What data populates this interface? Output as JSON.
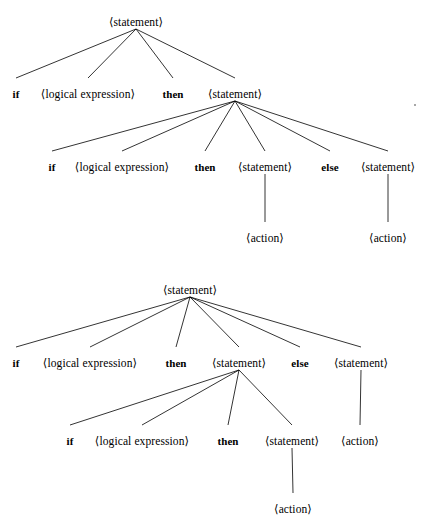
{
  "figure": {
    "background_color": "#ffffff",
    "ink_color": "#000000",
    "trees": [
      {
        "name": "tree-top",
        "description": "else associated with the inner (second) if statement",
        "nodes": [
          {
            "id": "t1-root",
            "label": "⟨statement⟩",
            "kind": "nonterminal",
            "x": 136,
            "y": 16
          },
          {
            "id": "t1-if",
            "label": "if",
            "kind": "terminal",
            "x": 16,
            "y": 88
          },
          {
            "id": "t1-logexp",
            "label": "⟨logical expression⟩",
            "kind": "nonterminal",
            "x": 88,
            "y": 88
          },
          {
            "id": "t1-then",
            "label": "then",
            "kind": "terminal",
            "x": 173,
            "y": 88
          },
          {
            "id": "t1-stmt",
            "label": "⟨statement⟩",
            "kind": "nonterminal",
            "x": 235,
            "y": 88
          },
          {
            "id": "t1-if2",
            "label": "if",
            "kind": "terminal",
            "x": 52,
            "y": 161
          },
          {
            "id": "t1-logexp2",
            "label": "⟨logical expression⟩",
            "kind": "nonterminal",
            "x": 122,
            "y": 161
          },
          {
            "id": "t1-then2",
            "label": "then",
            "kind": "terminal",
            "x": 205,
            "y": 161
          },
          {
            "id": "t1-stmt2",
            "label": "⟨statement⟩",
            "kind": "nonterminal",
            "x": 265,
            "y": 161
          },
          {
            "id": "t1-else",
            "label": "else",
            "kind": "terminal",
            "x": 330,
            "y": 161
          },
          {
            "id": "t1-stmt3",
            "label": "⟨statement⟩",
            "kind": "nonterminal",
            "x": 388,
            "y": 161
          },
          {
            "id": "t1-action1",
            "label": "⟨action⟩",
            "kind": "nonterminal",
            "x": 265,
            "y": 232
          },
          {
            "id": "t1-action2",
            "label": "⟨action⟩",
            "kind": "nonterminal",
            "x": 388,
            "y": 232
          }
        ],
        "edges": [
          {
            "from": "t1-root",
            "to": "t1-if"
          },
          {
            "from": "t1-root",
            "to": "t1-logexp"
          },
          {
            "from": "t1-root",
            "to": "t1-then"
          },
          {
            "from": "t1-root",
            "to": "t1-stmt"
          },
          {
            "from": "t1-stmt",
            "to": "t1-if2"
          },
          {
            "from": "t1-stmt",
            "to": "t1-logexp2"
          },
          {
            "from": "t1-stmt",
            "to": "t1-then2"
          },
          {
            "from": "t1-stmt",
            "to": "t1-stmt2"
          },
          {
            "from": "t1-stmt",
            "to": "t1-else"
          },
          {
            "from": "t1-stmt",
            "to": "t1-stmt3"
          },
          {
            "from": "t1-stmt2",
            "to": "t1-action1"
          },
          {
            "from": "t1-stmt3",
            "to": "t1-action2"
          }
        ]
      },
      {
        "name": "tree-bottom",
        "description": "else associated with the outer (first) if statement",
        "nodes": [
          {
            "id": "t2-root",
            "label": "⟨statement⟩",
            "kind": "nonterminal",
            "x": 190,
            "y": 284
          },
          {
            "id": "t2-if",
            "label": "if",
            "kind": "terminal",
            "x": 16,
            "y": 357
          },
          {
            "id": "t2-logexp",
            "label": "⟨logical expression⟩",
            "kind": "nonterminal",
            "x": 90,
            "y": 357
          },
          {
            "id": "t2-then",
            "label": "then",
            "kind": "terminal",
            "x": 176,
            "y": 357
          },
          {
            "id": "t2-stmt",
            "label": "⟨statement⟩",
            "kind": "nonterminal",
            "x": 239,
            "y": 357
          },
          {
            "id": "t2-else",
            "label": "else",
            "kind": "terminal",
            "x": 300,
            "y": 357
          },
          {
            "id": "t2-stmt3",
            "label": "⟨statement⟩",
            "kind": "nonterminal",
            "x": 361,
            "y": 357
          },
          {
            "id": "t2-if2",
            "label": "if",
            "kind": "terminal",
            "x": 70,
            "y": 435
          },
          {
            "id": "t2-logexp2",
            "label": "⟨logical expression⟩",
            "kind": "nonterminal",
            "x": 142,
            "y": 435
          },
          {
            "id": "t2-then2",
            "label": "then",
            "kind": "terminal",
            "x": 228,
            "y": 435
          },
          {
            "id": "t2-stmt2",
            "label": "⟨statement⟩",
            "kind": "nonterminal",
            "x": 292,
            "y": 435
          },
          {
            "id": "t2-action1",
            "label": "⟨action⟩",
            "kind": "nonterminal",
            "x": 360,
            "y": 435
          },
          {
            "id": "t2-action2",
            "label": "⟨action⟩",
            "kind": "nonterminal",
            "x": 293,
            "y": 503
          }
        ],
        "edges": [
          {
            "from": "t2-root",
            "to": "t2-if"
          },
          {
            "from": "t2-root",
            "to": "t2-logexp"
          },
          {
            "from": "t2-root",
            "to": "t2-then"
          },
          {
            "from": "t2-root",
            "to": "t2-stmt"
          },
          {
            "from": "t2-root",
            "to": "t2-else"
          },
          {
            "from": "t2-root",
            "to": "t2-stmt3"
          },
          {
            "from": "t2-stmt",
            "to": "t2-if2"
          },
          {
            "from": "t2-stmt",
            "to": "t2-logexp2"
          },
          {
            "from": "t2-stmt",
            "to": "t2-then2"
          },
          {
            "from": "t2-stmt",
            "to": "t2-stmt2"
          },
          {
            "from": "t2-stmt3",
            "to": "t2-action1"
          },
          {
            "from": "t2-stmt2",
            "to": "t2-action2"
          }
        ]
      }
    ],
    "specks": [
      {
        "x": 414,
        "y": 104
      }
    ]
  }
}
